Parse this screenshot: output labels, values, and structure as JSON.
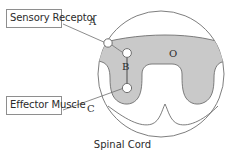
{
  "figure": {
    "caption": "Spinal Cord",
    "labels": {
      "sensory_receptor": "Sensory Receptor",
      "effector_muscle": "Effector Muscle"
    },
    "markers": {
      "a": "A",
      "b": "B",
      "c": "C",
      "o": "O"
    },
    "colors": {
      "gray_matter": "#c9c9c9",
      "outline": "#6f6f6f",
      "text": "#2b2b2b",
      "box_border": "#8e8e8e",
      "background": "#ffffff",
      "node_fill": "#ffffff"
    }
  }
}
